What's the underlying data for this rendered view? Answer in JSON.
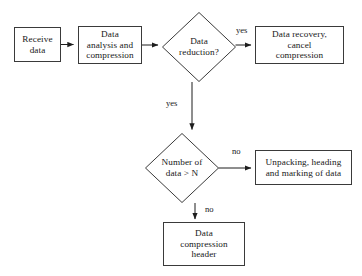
{
  "diagram": {
    "type": "flowchart",
    "background_color": "#ffffff",
    "stroke_color": "#3a3a3a",
    "text_color": "#181818",
    "nodes": [
      {
        "id": "receive-data",
        "shape": "process",
        "label": "Receive\ndata",
        "x": 14,
        "y": 27,
        "w": 47,
        "h": 35
      },
      {
        "id": "data-analysis",
        "shape": "process",
        "label": "Data\nanalysis and\ncompression",
        "x": 78,
        "y": 26,
        "w": 64,
        "h": 38
      },
      {
        "id": "data-reduction",
        "shape": "decision",
        "label": "Data\nreduction?",
        "x": 162,
        "y": 12,
        "w": 74,
        "h": 70
      },
      {
        "id": "data-recovery",
        "shape": "process",
        "label": "Data recovery,\ncancel\ncompression",
        "x": 255,
        "y": 26,
        "w": 89,
        "h": 38
      },
      {
        "id": "number-of-data",
        "shape": "decision",
        "label": "Number of\ndata > N",
        "x": 145,
        "y": 133,
        "w": 74,
        "h": 70
      },
      {
        "id": "unpacking",
        "shape": "process",
        "label": "Unpacking, heading\nand marking of data",
        "x": 255,
        "y": 150,
        "w": 97,
        "h": 35
      },
      {
        "id": "compression-header",
        "shape": "process",
        "label": "Data\ncompression\nheader",
        "x": 163,
        "y": 222,
        "w": 82,
        "h": 44
      }
    ],
    "edges": [
      {
        "id": "e1",
        "from": "receive-data",
        "to": "data-analysis",
        "label": ""
      },
      {
        "id": "e2",
        "from": "data-analysis",
        "to": "data-reduction",
        "label": ""
      },
      {
        "id": "e3",
        "from": "data-reduction",
        "to": "data-recovery",
        "label": "yes",
        "label_x": 236,
        "label_y": 26
      },
      {
        "id": "e4",
        "from": "data-reduction",
        "to": "number-of-data",
        "label": "yes",
        "label_x": 166,
        "label_y": 99
      },
      {
        "id": "e5",
        "from": "number-of-data",
        "to": "unpacking",
        "label": "no",
        "label_x": 232,
        "label_y": 147
      },
      {
        "id": "e6",
        "from": "number-of-data",
        "to": "compression-header",
        "label": "no",
        "label_x": 205,
        "label_y": 205
      }
    ]
  }
}
